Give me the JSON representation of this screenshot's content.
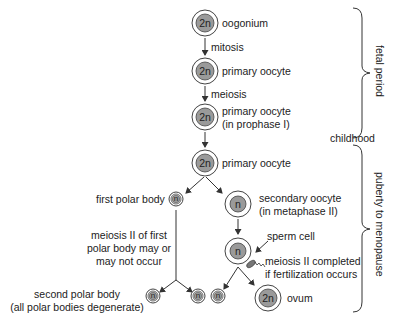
{
  "cells": {
    "oogonium": {
      "ploidy": "2n",
      "label": "oogonium"
    },
    "primary_oocyte_1": {
      "ploidy": "2n",
      "label": "primary oocyte"
    },
    "primary_oocyte_prophase": {
      "ploidy": "2n",
      "label_line1": "primary oocyte",
      "label_line2": "(in prophase I)"
    },
    "primary_oocyte_2": {
      "ploidy": "2n",
      "label": "primary oocyte"
    },
    "first_polar_body": {
      "ploidy": "n",
      "label": "first polar body"
    },
    "secondary_oocyte": {
      "ploidy": "n",
      "label_line1": "secondary oocyte",
      "label_line2": "(in metaphase II)"
    },
    "fertilized": {
      "ploidy": "n"
    },
    "second_polar_bodies": [
      {
        "ploidy": "n"
      },
      {
        "ploidy": "n"
      },
      {
        "ploidy": "n"
      }
    ],
    "ovum": {
      "ploidy": "2n",
      "label": "ovum"
    }
  },
  "processes": {
    "mitosis": "mitosis",
    "meiosis": "meiosis"
  },
  "notes": {
    "polar_meiosis_line1": "meiosis II of first",
    "polar_meiosis_line2": "polar body may or",
    "polar_meiosis_line3": "may not occur",
    "sperm": "sperm cell",
    "completion_line1": "meiosis II completed",
    "completion_line2": "if fertilization occurs",
    "second_polar_line1": "second polar body",
    "second_polar_line2": "(all polar bodies degenerate)"
  },
  "periods": {
    "fetal": "fetal period",
    "childhood": "childhood",
    "puberty": "puberty to menopause"
  },
  "colors": {
    "nucleus": "#9a9a9a",
    "line": "#333333"
  }
}
